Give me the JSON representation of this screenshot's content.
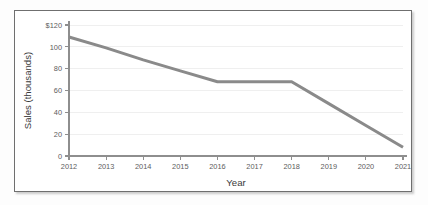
{
  "chart_data": {
    "type": "line",
    "title": "",
    "xlabel": "Year",
    "ylabel": "Sales (thousands)",
    "x": [
      2012,
      2013,
      2014,
      2015,
      2016,
      2017,
      2018,
      2019,
      2020,
      2021
    ],
    "categories": [
      "2012",
      "2013",
      "2014",
      "2015",
      "2016",
      "2017",
      "2018",
      "2019",
      "2020",
      "2021"
    ],
    "values": [
      109,
      99,
      88,
      78,
      68,
      68,
      68,
      48,
      28,
      8
    ],
    "series": [
      {
        "name": "Sales",
        "color": "#8a8a8a",
        "values": [
          109,
          99,
          88,
          78,
          68,
          68,
          68,
          48,
          28,
          8
        ]
      }
    ],
    "xlim": [
      2012,
      2021
    ],
    "ylim": [
      0,
      120
    ],
    "xticks": [
      "2012",
      "2013",
      "2014",
      "2015",
      "2016",
      "2017",
      "2018",
      "2019",
      "2020",
      "2021"
    ],
    "yticks": [
      "0",
      "20",
      "40",
      "60",
      "80",
      "100",
      "$120"
    ],
    "ytick_values": [
      0,
      20,
      40,
      60,
      80,
      100,
      120
    ],
    "grid": "horizontal",
    "legend": "none",
    "line_width": 3,
    "colors": {
      "line": "#8a8a8a",
      "axis": "#8e8e8e",
      "grid": "#efefef",
      "tick_text": "#5d5d5d",
      "axis_title": "#3a3a3a",
      "frame_border": "#6f6f6f",
      "background": "#ffffff"
    }
  }
}
